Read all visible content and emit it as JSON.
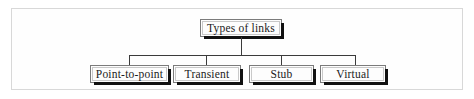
{
  "figure": {
    "kind": "tree-diagram",
    "title_text": "Types of links",
    "frame_color": "#d8d8d8",
    "line_color": "#3b3b3b",
    "box_border_color": "#7b7b7b",
    "box_fill_color": "#fdfdfd",
    "shadow_color": "#111111",
    "text_color": "#1b1b1b",
    "background_color": "#ffffff"
  },
  "diagram": {
    "root": {
      "label": "Types of links"
    },
    "children": [
      {
        "label": "Point-to-point"
      },
      {
        "label": "Transient"
      },
      {
        "label": "Stub"
      },
      {
        "label": "Virtual"
      }
    ]
  }
}
